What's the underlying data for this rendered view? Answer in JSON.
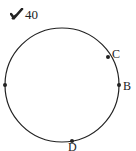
{
  "header": {
    "icon": "checkmark-pencil-icon",
    "problem_number": "40"
  },
  "diagram": {
    "shape": "circle",
    "center": [
      62,
      85
    ],
    "radius": 57,
    "stroke_color": "#222222",
    "points": [
      {
        "name": "A",
        "label": "",
        "x": 5,
        "y": 85
      },
      {
        "name": "C",
        "label": "C",
        "x": 108,
        "y": 57
      },
      {
        "name": "B",
        "label": "B",
        "x": 119,
        "y": 85
      },
      {
        "name": "D",
        "label": "D",
        "x": 72,
        "y": 141
      }
    ],
    "labels": {
      "C": "C",
      "B": "B",
      "D": "D"
    }
  }
}
